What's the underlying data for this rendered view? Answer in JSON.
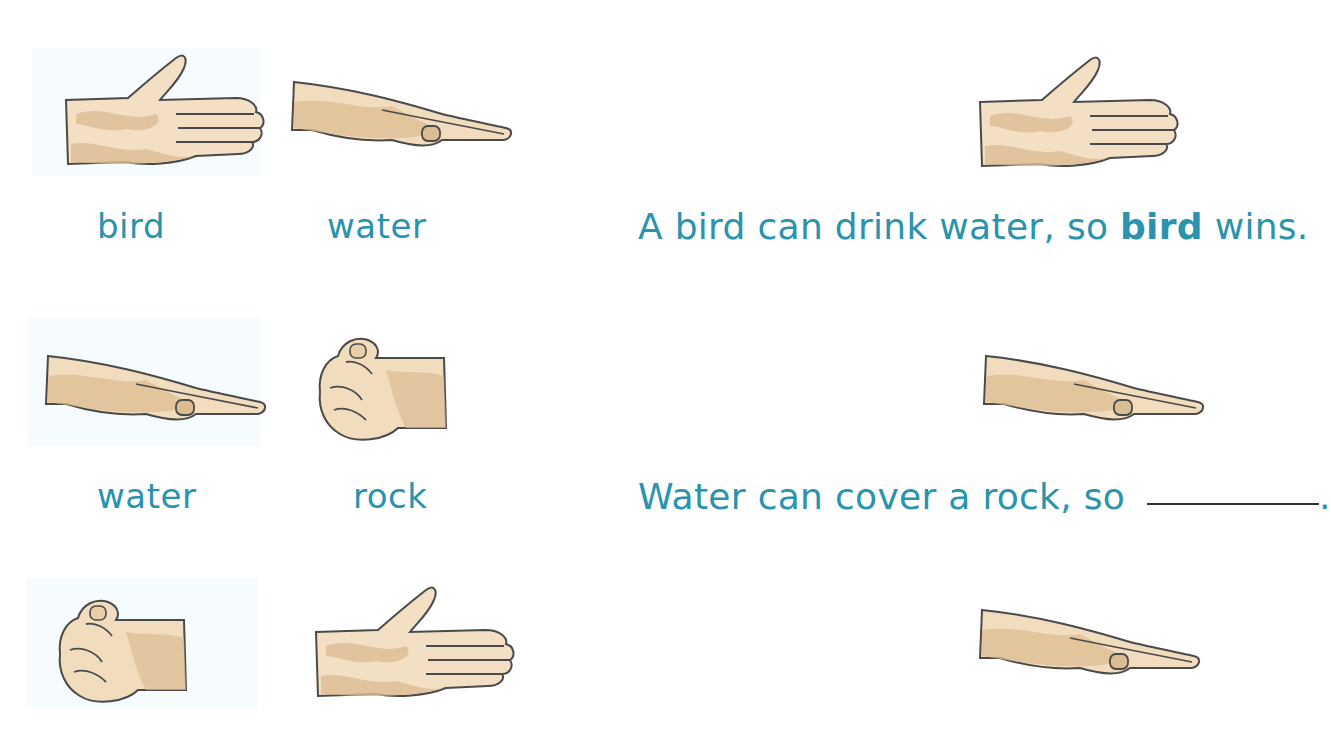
{
  "rounds": [
    {
      "left": {
        "gesture": "bird",
        "label": "bird",
        "icon": "open-hand-icon"
      },
      "right": {
        "gesture": "water",
        "label": "water",
        "icon": "flat-hand-icon"
      },
      "result_icon": "open-hand-icon",
      "sentence": {
        "prefix": "A bird can drink water, so ",
        "bold": "bird",
        "suffix": " wins."
      }
    },
    {
      "left": {
        "gesture": "water",
        "label": "water",
        "icon": "flat-hand-icon"
      },
      "right": {
        "gesture": "rock",
        "label": "rock",
        "icon": "fist-icon"
      },
      "result_icon": "flat-hand-icon",
      "sentence": {
        "prefix": "Water can cover a rock, so ",
        "blank": "",
        "suffix": "."
      }
    },
    {
      "left": {
        "gesture": "rock",
        "label": "",
        "icon": "fist-icon"
      },
      "right": {
        "gesture": "bird",
        "label": "",
        "icon": "open-hand-icon"
      },
      "result_icon": "flat-hand-icon"
    }
  ],
  "colors": {
    "text": "#2a93ad",
    "skin": "#f1dcbd",
    "skin_shadow": "#dcbc93",
    "outline": "#4a4a4a",
    "panel": "#f6fbfd"
  }
}
